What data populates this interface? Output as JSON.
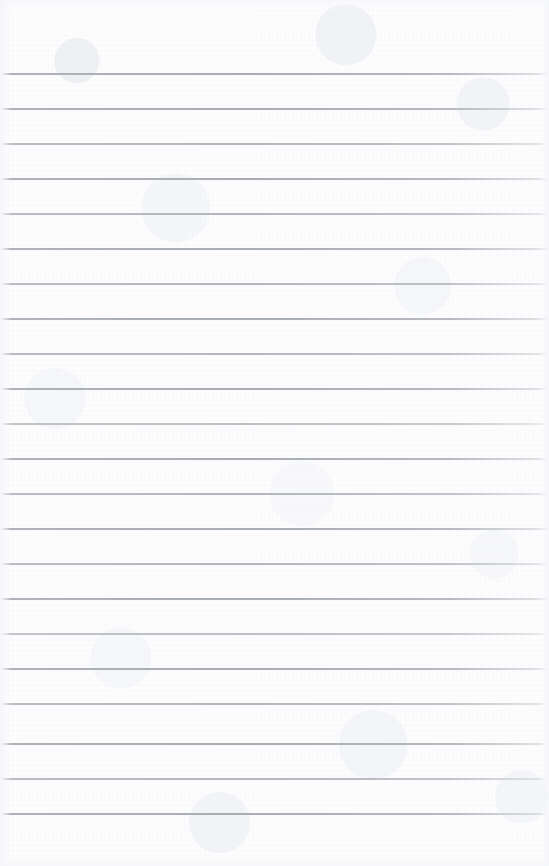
{
  "document": {
    "kind": "blank-ruled-notepad-page",
    "title": "Blank Ruled Notepad Page",
    "orientation": "portrait",
    "width_px": 549,
    "height_px": 866,
    "has_text_content": false,
    "has_handwriting": false,
    "has_margin_rule": false,
    "has_header": false,
    "has_footer": false,
    "has_page_number": false,
    "has_holes": false
  },
  "paper": {
    "background_color": "#fdfdfe",
    "tone_description": "near-white scanned paper with faint mottled fibre texture",
    "edge_color": "#f4f5f8"
  },
  "ruling": {
    "line_color": "#a8acb3",
    "line_color_faded": "#c4c8ce",
    "line_thickness_px": 1.6,
    "line_spacing_px": 35,
    "first_line_y_px": 73,
    "last_line_y_px": 813,
    "line_count": 22,
    "top_margin_px": 73,
    "bottom_margin_px": 53,
    "left_inset_px": 2,
    "right_inset_px": 2,
    "lines": [
      {
        "index": 1,
        "y": 73,
        "weight": "strong"
      },
      {
        "index": 2,
        "y": 108,
        "weight": "strong"
      },
      {
        "index": 3,
        "y": 143,
        "weight": "soft"
      },
      {
        "index": 4,
        "y": 178,
        "weight": "strong"
      },
      {
        "index": 5,
        "y": 213,
        "weight": "soft"
      },
      {
        "index": 6,
        "y": 248,
        "weight": "strong"
      },
      {
        "index": 7,
        "y": 283,
        "weight": "soft"
      },
      {
        "index": 8,
        "y": 318,
        "weight": "strong"
      },
      {
        "index": 9,
        "y": 353,
        "weight": "soft"
      },
      {
        "index": 10,
        "y": 388,
        "weight": "strong"
      },
      {
        "index": 11,
        "y": 423,
        "weight": "softer"
      },
      {
        "index": 12,
        "y": 458,
        "weight": "strong"
      },
      {
        "index": 13,
        "y": 493,
        "weight": "soft"
      },
      {
        "index": 14,
        "y": 528,
        "weight": "strong"
      },
      {
        "index": 15,
        "y": 563,
        "weight": "soft"
      },
      {
        "index": 16,
        "y": 598,
        "weight": "strong"
      },
      {
        "index": 17,
        "y": 633,
        "weight": "softer"
      },
      {
        "index": 18,
        "y": 668,
        "weight": "strong"
      },
      {
        "index": 19,
        "y": 703,
        "weight": "soft"
      },
      {
        "index": 20,
        "y": 743,
        "weight": "strong"
      },
      {
        "index": 21,
        "y": 778,
        "weight": "soft"
      },
      {
        "index": 22,
        "y": 813,
        "weight": "strong"
      }
    ]
  }
}
